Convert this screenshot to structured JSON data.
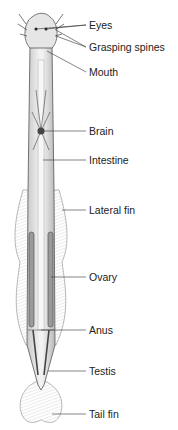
{
  "diagram": {
    "labels": [
      {
        "id": "eyes",
        "text": "Eyes",
        "y": 19
      },
      {
        "id": "grasping-spines",
        "text": "Grasping spines",
        "y": 41
      },
      {
        "id": "mouth",
        "text": "Mouth",
        "y": 66
      },
      {
        "id": "brain",
        "text": "Brain",
        "y": 125
      },
      {
        "id": "intestine",
        "text": "Intestine",
        "y": 154
      },
      {
        "id": "lateral-fin",
        "text": "Lateral fin",
        "y": 204
      },
      {
        "id": "ovary",
        "text": "Ovary",
        "y": 271
      },
      {
        "id": "anus",
        "text": "Anus",
        "y": 324
      },
      {
        "id": "testis",
        "text": "Testis",
        "y": 365
      },
      {
        "id": "tail-fin",
        "text": "Tail fin",
        "y": 408
      }
    ]
  }
}
